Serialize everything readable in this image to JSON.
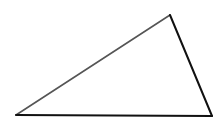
{
  "diagram": {
    "type": "triangle",
    "background": "#ffffff",
    "vertices": {
      "top": {
        "x": 170,
        "y": 15
      },
      "left": {
        "x": 16,
        "y": 115
      },
      "right": {
        "x": 212,
        "y": 116
      }
    },
    "edges": [
      {
        "name": "edge-left-top",
        "from": "left",
        "to": "top",
        "color": "#555555",
        "width": 1.6
      },
      {
        "name": "edge-top-right",
        "from": "top",
        "to": "right",
        "color": "#111111",
        "width": 2
      },
      {
        "name": "edge-left-right",
        "from": "left",
        "to": "right",
        "color": "#111111",
        "width": 2
      }
    ]
  }
}
